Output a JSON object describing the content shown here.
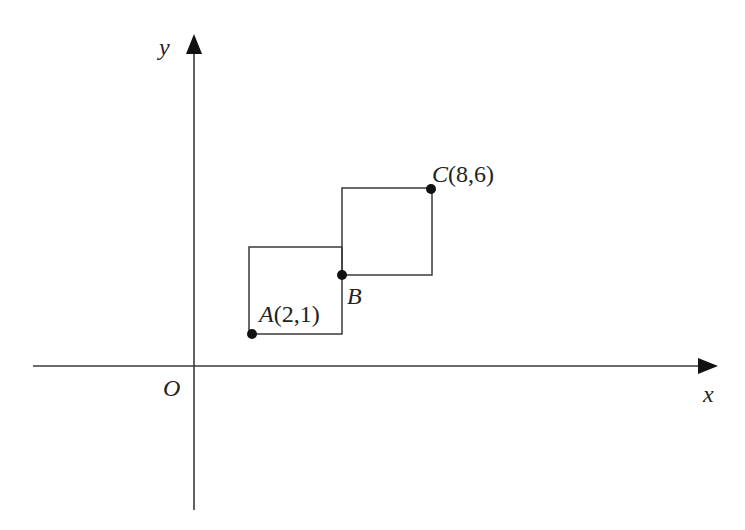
{
  "diagram": {
    "type": "coordinate-plane",
    "axes": {
      "x_label": "x",
      "y_label": "y",
      "origin_label": "O"
    },
    "points": [
      {
        "name": "A",
        "coords": "(2,1)",
        "label_letter": "A",
        "label_coords": "(2,1)"
      },
      {
        "name": "B",
        "coords": "",
        "label_letter": "B",
        "label_coords": ""
      },
      {
        "name": "C",
        "coords": "(8,6)",
        "label_letter": "C",
        "label_coords": "(8,6)"
      }
    ],
    "shapes": [
      {
        "name": "square-lower",
        "description": "square with bottom-left corner at A and top-right region reaching B's vertical"
      },
      {
        "name": "square-upper",
        "description": "square with bottom-left corner at B and top-right corner at C"
      }
    ],
    "colors": {
      "stroke": "#3a3a3a",
      "point": "#111111",
      "text": "#222222"
    }
  }
}
